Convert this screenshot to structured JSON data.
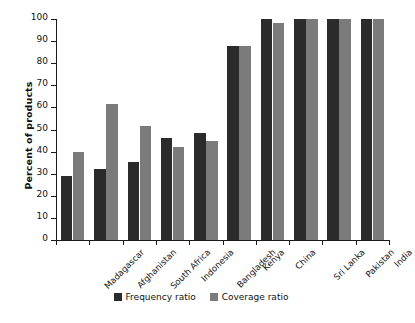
{
  "chart_data": {
    "type": "bar",
    "title": "",
    "xlabel": "",
    "ylabel": "Percent of products",
    "ylim": [
      0,
      100
    ],
    "ytick_step": 10,
    "yticks": [
      0,
      10,
      20,
      30,
      40,
      50,
      60,
      70,
      80,
      90,
      100
    ],
    "grid": false,
    "legend_position": "bottom-center",
    "categories": [
      "Madagascar",
      "Afghanistan",
      "South Africa",
      "Indonesia",
      "Bangladesh",
      "Kenya",
      "China",
      "Sri Lanka",
      "Pakistan",
      "India"
    ],
    "series": [
      {
        "name": "Frequency ratio",
        "color": "#2b2b2b",
        "values": [
          29,
          32,
          35.5,
          46,
          48.5,
          88,
          100,
          100,
          100,
          100
        ]
      },
      {
        "name": "Coverage ratio",
        "color": "#7b7b7b",
        "values": [
          40,
          61.5,
          51.5,
          42,
          45,
          88,
          98,
          100,
          100,
          100
        ]
      }
    ]
  },
  "legend": {
    "items": [
      {
        "label": "Frequency ratio",
        "swatch": "freq"
      },
      {
        "label": "Coverage ratio",
        "swatch": "cov"
      }
    ]
  },
  "colors": {
    "frequency_ratio": "#2b2b2b",
    "coverage_ratio": "#7b7b7b",
    "axis": "#1a1a1a",
    "background": "#ffffff",
    "text": "#111111"
  }
}
